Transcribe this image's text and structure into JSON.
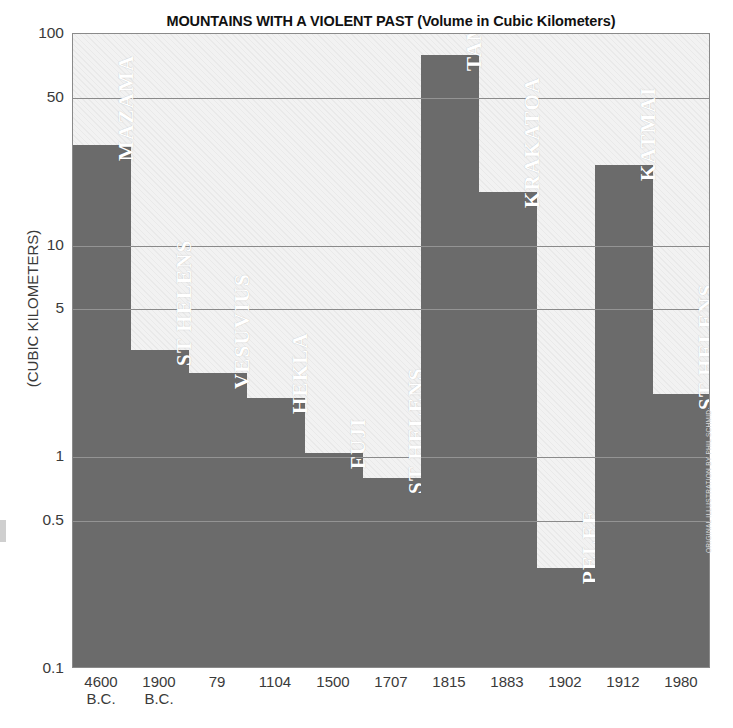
{
  "chart_data": {
    "type": "bar",
    "title": "MOUNTAINS WITH A VIOLENT PAST (Volume in Cubic Kilometers)",
    "xlabel": "",
    "ylabel": "(CUBIC KILOMETERS)",
    "yscale": "log",
    "ylim": [
      0.1,
      100
    ],
    "yticks": [
      100,
      50,
      10,
      5,
      1,
      0.5,
      0.1
    ],
    "ytick_labels": [
      "100",
      "50",
      "10",
      "5",
      "1",
      "0.5",
      "0.1"
    ],
    "grid": true,
    "legend": "none",
    "categories": [
      "MAZAMA",
      "ST HELENS",
      "VESUVIUS",
      "HEKLA",
      "FUJI",
      "ST HELENS",
      "TAMBORA",
      "KRAKATOA",
      "PELEE",
      "KATMAI",
      "ST HELENS"
    ],
    "x": [
      "4600 B.C.",
      "1900 B.C.",
      "79",
      "1104",
      "1500",
      "1707",
      "1815",
      "1883",
      "1902",
      "1912",
      "1980"
    ],
    "values": [
      30,
      3.2,
      2.5,
      1.9,
      1.05,
      0.8,
      80,
      18,
      0.3,
      24,
      2.0
    ],
    "bars": [
      {
        "name": "MAZAMA",
        "year": "4600",
        "year2": "B.C.",
        "value": 30
      },
      {
        "name": "ST HELENS",
        "year": "1900",
        "year2": "B.C.",
        "value": 3.2
      },
      {
        "name": "VESUVIUS",
        "year": "79",
        "year2": "",
        "value": 2.5
      },
      {
        "name": "HEKLA",
        "year": "1104",
        "year2": "",
        "value": 1.9
      },
      {
        "name": "FUJI",
        "year": "1500",
        "year2": "",
        "value": 1.05
      },
      {
        "name": "ST HELENS",
        "year": "1707",
        "year2": "",
        "value": 0.8
      },
      {
        "name": "TAMBORA",
        "year": "1815",
        "year2": "",
        "value": 80
      },
      {
        "name": "KRAKATOA",
        "year": "1883",
        "year2": "",
        "value": 18
      },
      {
        "name": "PELEE",
        "year": "1902",
        "year2": "",
        "value": 0.3
      },
      {
        "name": "KATMAI",
        "year": "1912",
        "year2": "",
        "value": 24
      },
      {
        "name": "ST HELENS",
        "year": "1980",
        "year2": "",
        "value": 2.0
      }
    ]
  },
  "credit": "ORIGINAL ILLUSTRATION BY PHIL SCHMID",
  "colors": {
    "bar": "#6b6b6b",
    "plot_background": "#f2f2f2",
    "gridline": "#5d5d5d",
    "frame": "#8a8a8a",
    "bar_label": "#ffffff",
    "axis_text": "#3a3a3a"
  }
}
